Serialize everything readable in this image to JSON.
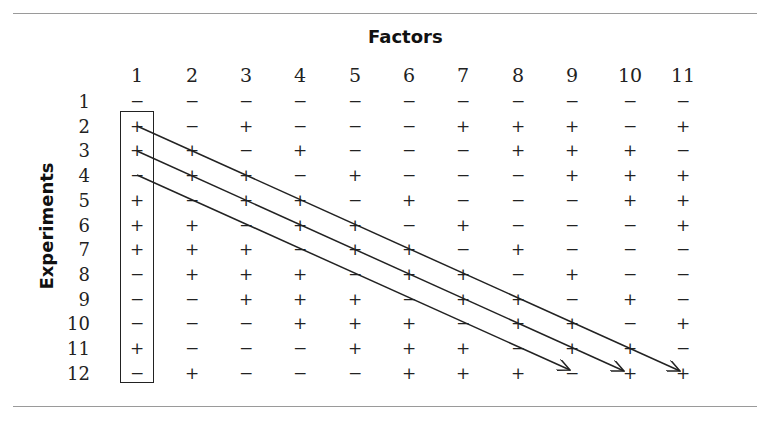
{
  "title": "Factors",
  "row_axis_label": "Experiments",
  "factors": [
    "1",
    "2",
    "3",
    "4",
    "5",
    "6",
    "7",
    "8",
    "9",
    "10",
    "11"
  ],
  "experiments": [
    "1",
    "2",
    "3",
    "4",
    "5",
    "6",
    "7",
    "8",
    "9",
    "10",
    "11",
    "12"
  ],
  "matrix": [
    [
      "−",
      "−",
      "−",
      "−",
      "−",
      "−",
      "−",
      "−",
      "−",
      "−",
      "−"
    ],
    [
      "+",
      "−",
      "+",
      "−",
      "−",
      "−",
      "+",
      "+",
      "+",
      "−",
      "+"
    ],
    [
      "+",
      "+",
      "−",
      "+",
      "−",
      "−",
      "−",
      "+",
      "+",
      "+",
      "−"
    ],
    [
      "−",
      "+",
      "+",
      "−",
      "+",
      "−",
      "−",
      "−",
      "+",
      "+",
      "+"
    ],
    [
      "+",
      "−",
      "+",
      "+",
      "−",
      "+",
      "−",
      "−",
      "−",
      "+",
      "+"
    ],
    [
      "+",
      "+",
      "−",
      "+",
      "+",
      "−",
      "+",
      "−",
      "−",
      "−",
      "+"
    ],
    [
      "+",
      "+",
      "+",
      "−",
      "+",
      "+",
      "−",
      "+",
      "−",
      "−",
      "−"
    ],
    [
      "−",
      "+",
      "+",
      "+",
      "−",
      "+",
      "+",
      "−",
      "+",
      "−",
      "−"
    ],
    [
      "−",
      "−",
      "+",
      "+",
      "+",
      "−",
      "+",
      "+",
      "−",
      "+",
      "−"
    ],
    [
      "−",
      "−",
      "−",
      "+",
      "+",
      "+",
      "−",
      "+",
      "+",
      "−",
      "+"
    ],
    [
      "+",
      "−",
      "−",
      "−",
      "+",
      "+",
      "+",
      "−",
      "+",
      "+",
      "−"
    ],
    [
      "−",
      "+",
      "−",
      "−",
      "−",
      "+",
      "+",
      "+",
      "−",
      "+",
      "+"
    ]
  ],
  "highlight": {
    "boxed_column": "1",
    "boxed_rows": "1-12"
  },
  "arrows": [
    {
      "from": "row 2, factor 1",
      "to": "row 12, factor 11"
    },
    {
      "from": "row 3, factor 1",
      "to": "row 12, factor 10"
    },
    {
      "from": "row 4, factor 1",
      "to": "row 12, factor 9"
    }
  ],
  "colors": {
    "text": "#222222",
    "rule": "#9a9a9a",
    "background": "#ffffff"
  }
}
